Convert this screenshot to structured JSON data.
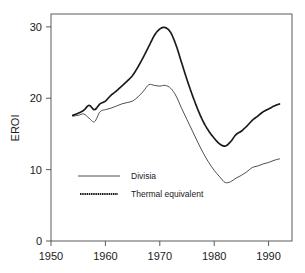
{
  "chart_data": {
    "type": "line",
    "title": "",
    "xlabel": "",
    "ylabel": "EROI",
    "xlim": [
      1950,
      1994.3
    ],
    "ylim": [
      0,
      31.8
    ],
    "grid": false,
    "legend_position": "inside-lower-left",
    "xticks": [
      1950,
      1960,
      1970,
      1980,
      1990
    ],
    "xtick_labels": [
      "1950",
      "1960",
      "1970",
      "1980",
      "1990"
    ],
    "yticks": [
      0,
      10,
      20,
      30
    ],
    "ytick_labels": [
      "0",
      "10",
      "20",
      "30"
    ],
    "series": [
      {
        "name": "Divisia",
        "style": "solid",
        "x": [
          1954,
          1955,
          1956,
          1957,
          1958,
          1959,
          1960,
          1961,
          1962,
          1963,
          1964,
          1965,
          1966,
          1967,
          1968,
          1969,
          1970,
          1971,
          1972,
          1973,
          1974,
          1975,
          1976,
          1977,
          1978,
          1979,
          1980,
          1981,
          1982,
          1983,
          1984,
          1985,
          1986,
          1987,
          1988,
          1989,
          1990,
          1991,
          1992
        ],
        "values": [
          17.5,
          17.6,
          17.8,
          17.2,
          16.7,
          18.1,
          18.4,
          18.6,
          18.9,
          19.2,
          19.4,
          19.6,
          20.2,
          21.0,
          21.9,
          21.8,
          21.7,
          21.8,
          21.4,
          20.3,
          18.6,
          17.0,
          15.4,
          13.8,
          12.3,
          11.0,
          9.9,
          9.0,
          8.2,
          8.3,
          8.8,
          9.2,
          9.7,
          10.3,
          10.5,
          10.8,
          11.0,
          11.3,
          11.5
        ]
      },
      {
        "name": "Thermal equivalent",
        "style": "dashed-thick",
        "x": [
          1954,
          1955,
          1956,
          1957,
          1958,
          1959,
          1960,
          1961,
          1962,
          1963,
          1964,
          1965,
          1966,
          1967,
          1968,
          1969,
          1970,
          1971,
          1972,
          1973,
          1974,
          1975,
          1976,
          1977,
          1978,
          1979,
          1980,
          1981,
          1982,
          1983,
          1984,
          1985,
          1986,
          1987,
          1988,
          1989,
          1990,
          1991,
          1992
        ],
        "values": [
          17.6,
          17.9,
          18.3,
          19.0,
          18.4,
          19.2,
          19.6,
          20.4,
          21.0,
          21.7,
          22.4,
          23.2,
          24.4,
          25.8,
          27.3,
          28.8,
          29.7,
          29.9,
          29.2,
          27.4,
          25.0,
          22.6,
          20.4,
          18.4,
          16.7,
          15.4,
          14.4,
          13.6,
          13.3,
          13.9,
          14.9,
          15.4,
          16.1,
          16.9,
          17.5,
          18.1,
          18.5,
          18.9,
          19.2
        ]
      }
    ],
    "legend_entries": [
      {
        "label": "Divisia",
        "style": "solid"
      },
      {
        "label": "Thermal equivalent",
        "style": "dashed-thick"
      }
    ]
  }
}
